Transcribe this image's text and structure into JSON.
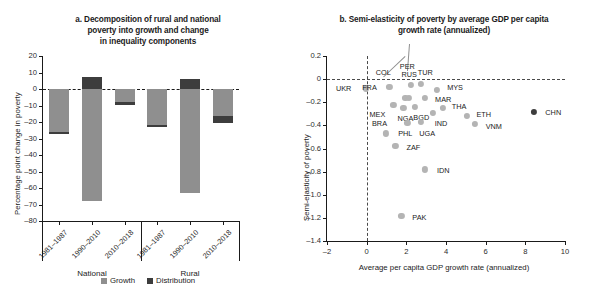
{
  "figure": {
    "panel_a": {
      "title": "a. Decomposition of rural and national poverty into growth and change in inequality components",
      "title_lines": [
        "a. Decomposition of rural and national",
        "poverty into growth and change",
        "in inequality components"
      ]
    },
    "panel_b": {
      "title": "b. Semi-elasticity of poverty by average GDP per capita growth rate (annualized)",
      "title_lines": [
        "b. Semi-elasticity of poverty by average GDP per capita",
        "growth rate (annualized)"
      ]
    }
  },
  "colors": {
    "growth": "#8f8f8f",
    "distribution": "#3d3d3d",
    "point": "#b4b4b4",
    "point_highlight": "#3d3d3d",
    "axis": "#1a1a1a"
  },
  "chart_data": [
    {
      "id": "panel-a",
      "type": "bar",
      "title": "a. Decomposition of rural and national poverty into growth and change in inequality components",
      "xlabel": "",
      "ylabel": "Percentage point change in poverty",
      "ylim": [
        -80,
        20
      ],
      "yticks": [
        20,
        10,
        0,
        -10,
        -20,
        -30,
        -40,
        -50,
        -60,
        -70,
        -80
      ],
      "ytick_labels": [
        "20",
        "10",
        "0",
        "–10",
        "–20",
        "–30",
        "–40",
        "–50",
        "–60",
        "–70",
        "–80"
      ],
      "grid": false,
      "stacked": true,
      "legend": [
        {
          "label": "Growth",
          "color": "#8f8f8f"
        },
        {
          "label": "Distribution",
          "color": "#3d3d3d"
        }
      ],
      "groups": [
        {
          "label": "National",
          "categories": [
            "1981–1987",
            "1990–2010",
            "2010–2018"
          ]
        },
        {
          "label": "Rural",
          "categories": [
            "1981–1987",
            "1990–2010",
            "2010–2018"
          ]
        }
      ],
      "categories": [
        "1981–1987",
        "1990–2010",
        "2010–2018",
        "1981–1987",
        "1990–2010",
        "2010–2018"
      ],
      "series": [
        {
          "name": "Growth",
          "color": "#8f8f8f",
          "values": [
            -26.5,
            -68.0,
            -8.5,
            -22.5,
            -63.0,
            -19.5
          ]
        },
        {
          "name": "Distribution",
          "color": "#3d3d3d",
          "values": [
            -0.5,
            7.0,
            -1.5,
            -0.7,
            6.2,
            -4.0
          ]
        }
      ],
      "bars": [
        {
          "group": "National",
          "category": "1981–1987",
          "growth": -26.5,
          "distribution": -0.5,
          "growth_top": 0,
          "growth_bottom": -26.0,
          "dist_top": -26.0,
          "dist_bottom": -26.5
        },
        {
          "group": "National",
          "category": "1990–2010",
          "growth": -68.0,
          "distribution": 7.0,
          "growth_top": 0,
          "growth_bottom": -68.0,
          "dist_top": 7.0,
          "dist_bottom": 0
        },
        {
          "group": "National",
          "category": "2010–2018",
          "growth": -8.5,
          "distribution": -1.5,
          "growth_top": 0,
          "growth_bottom": -8.0,
          "dist_top": -8.0,
          "dist_bottom": -9.5
        },
        {
          "group": "Rural",
          "category": "1981–1987",
          "growth": -22.5,
          "distribution": -0.7,
          "growth_top": 0,
          "growth_bottom": -22.0,
          "dist_top": -22.0,
          "dist_bottom": -23.0
        },
        {
          "group": "Rural",
          "category": "1990–2010",
          "growth": -63.0,
          "distribution": 6.2,
          "growth_top": 0,
          "growth_bottom": -63.0,
          "dist_top": 6.2,
          "dist_bottom": 0
        },
        {
          "group": "Rural",
          "category": "2010–2018",
          "growth": -19.5,
          "distribution": -4.0,
          "growth_top": 0,
          "growth_bottom": -16.5,
          "dist_top": -16.5,
          "dist_bottom": -20.5
        }
      ]
    },
    {
      "id": "panel-b",
      "type": "scatter",
      "title": "b. Semi-elasticity of poverty by average GDP per capita growth rate (annualized)",
      "xlabel": "Average per capita GDP growth rate (annualized)",
      "ylabel": "Semi-elasticity of poverty",
      "xlim": [
        -2,
        10
      ],
      "ylim": [
        -1.4,
        0.2
      ],
      "xticks": [
        -2,
        0,
        2,
        4,
        6,
        8,
        10
      ],
      "xtick_labels": [
        "–2",
        "0",
        "2",
        "4",
        "6",
        "8",
        "10"
      ],
      "yticks": [
        0.2,
        0,
        -0.2,
        -0.4,
        -0.6,
        -0.8,
        -1.0,
        -1.2,
        -1.4
      ],
      "ytick_labels": [
        "0.2",
        "0",
        "–0.2",
        "–0.4",
        "–0.6",
        "–0.8",
        "–1.0",
        "–1.2",
        "–1.4"
      ],
      "grid": false,
      "reference_lines": [
        {
          "axis": "y",
          "value": 0,
          "style": "dashed"
        },
        {
          "axis": "x",
          "value": 0,
          "style": "dashed"
        }
      ],
      "points": [
        {
          "label": "UKR",
          "x": -0.05,
          "y": -0.08,
          "highlight": false,
          "label_dx": -22,
          "label_dy": 0
        },
        {
          "label": "FRA",
          "x": 1.15,
          "y": -0.07,
          "highlight": false,
          "label_dx": -20,
          "label_dy": 0
        },
        {
          "label": "COL",
          "x": 1.95,
          "y": -0.16,
          "highlight": false,
          "label_dx": -22,
          "label_dy": -26,
          "leader": true
        },
        {
          "label": "PER",
          "x": 2.15,
          "y": -0.16,
          "highlight": false,
          "label_dx": -2,
          "label_dy": -32,
          "leader": true
        },
        {
          "label": "RUS",
          "x": 2.25,
          "y": -0.05,
          "highlight": false,
          "label_dx": -2,
          "label_dy": -11
        },
        {
          "label": "TUR",
          "x": 2.75,
          "y": -0.04,
          "highlight": false,
          "label_dx": 4,
          "label_dy": -12
        },
        {
          "label": "MYS",
          "x": 3.55,
          "y": -0.09,
          "highlight": false,
          "label_dx": 18,
          "label_dy": -3
        },
        {
          "label": "MAR",
          "x": 2.95,
          "y": -0.16,
          "highlight": false,
          "label_dx": 18,
          "label_dy": 1
        },
        {
          "label": "MEX",
          "x": 1.35,
          "y": -0.22,
          "highlight": false,
          "label_dx": -16,
          "label_dy": 9
        },
        {
          "label": "NGA",
          "x": 1.85,
          "y": -0.25,
          "highlight": false,
          "label_dx": 2,
          "label_dy": 10
        },
        {
          "label": "BGD",
          "x": 2.45,
          "y": -0.24,
          "highlight": false,
          "label_dx": 6,
          "label_dy": 10
        },
        {
          "label": "IND",
          "x": 3.35,
          "y": -0.29,
          "highlight": false,
          "label_dx": 8,
          "label_dy": 10
        },
        {
          "label": "THA",
          "x": 3.85,
          "y": -0.25,
          "highlight": false,
          "label_dx": 16,
          "label_dy": -2
        },
        {
          "label": "ETH",
          "x": 5.05,
          "y": -0.32,
          "highlight": false,
          "label_dx": 17,
          "label_dy": -2
        },
        {
          "label": "VNM",
          "x": 5.45,
          "y": -0.39,
          "highlight": false,
          "label_dx": 19,
          "label_dy": 2
        },
        {
          "label": "CHN",
          "x": 8.45,
          "y": -0.28,
          "highlight": true,
          "label_dx": 19,
          "label_dy": 0
        },
        {
          "label": "PHL",
          "x": 2.05,
          "y": -0.38,
          "highlight": false,
          "label_dx": -2,
          "label_dy": 10
        },
        {
          "label": "UGA",
          "x": 2.75,
          "y": -0.37,
          "highlight": false,
          "label_dx": 6,
          "label_dy": 11
        },
        {
          "label": "BRA",
          "x": 0.95,
          "y": -0.47,
          "highlight": false,
          "label_dx": -6,
          "label_dy": -10
        },
        {
          "label": "ZAF",
          "x": 1.45,
          "y": -0.58,
          "highlight": false,
          "label_dx": 18,
          "label_dy": 1
        },
        {
          "label": "IDN",
          "x": 2.95,
          "y": -0.78,
          "highlight": false,
          "label_dx": 18,
          "label_dy": 1
        },
        {
          "label": "PAK",
          "x": 1.75,
          "y": -1.18,
          "highlight": false,
          "label_dx": 18,
          "label_dy": 1
        }
      ]
    }
  ]
}
